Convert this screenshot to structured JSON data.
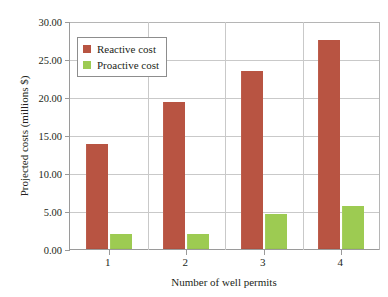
{
  "chart_data": {
    "type": "bar",
    "title": "",
    "xlabel": "Number of well permits",
    "ylabel": "Projected costs (millions $)",
    "categories": [
      "1",
      "2",
      "3",
      "4"
    ],
    "series": [
      {
        "name": "Reactive cost",
        "color": "#b85442",
        "values": [
          13.8,
          19.3,
          23.4,
          27.5
        ]
      },
      {
        "name": "Proactive cost",
        "color": "#9dcb52",
        "values": [
          2.0,
          2.0,
          4.6,
          5.6
        ]
      }
    ],
    "ylim": [
      0,
      30
    ],
    "ytick_step": 5,
    "ytick_labels": [
      "0.00",
      "5.00",
      "10.00",
      "15.00",
      "20.00",
      "25.00",
      "30.00"
    ],
    "grid": "both",
    "legend_position": "upper-left-inside"
  },
  "legend": {
    "items": [
      {
        "label": "Reactive cost",
        "swatch": "reactive"
      },
      {
        "label": "Proactive cost",
        "swatch": "proactive"
      }
    ]
  },
  "axis": {
    "y_labels": [
      "30.00",
      "25.00",
      "20.00",
      "15.00",
      "10.00",
      "5.00",
      "0.00"
    ],
    "x_labels": [
      "1",
      "2",
      "3",
      "4"
    ]
  }
}
